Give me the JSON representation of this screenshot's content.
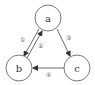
{
  "diagram": {
    "type": "directed-graph",
    "nodes": [
      {
        "id": "a",
        "label": "a",
        "cx": 48,
        "cy": 18,
        "r": 13
      },
      {
        "id": "b",
        "label": "b",
        "cx": 19,
        "cy": 68,
        "r": 13
      },
      {
        "id": "c",
        "label": "c",
        "cx": 77,
        "cy": 68,
        "r": 13
      }
    ],
    "edges": [
      {
        "id": "1",
        "label": "①",
        "from": "a",
        "to": "b"
      },
      {
        "id": "2",
        "label": "②",
        "from": "b",
        "to": "a"
      },
      {
        "id": "3",
        "label": "③",
        "from": "a",
        "to": "c"
      },
      {
        "id": "4",
        "label": "④",
        "from": "c",
        "to": "b"
      }
    ]
  },
  "colors": {
    "stroke": "#444444",
    "background": "#ffffff"
  }
}
